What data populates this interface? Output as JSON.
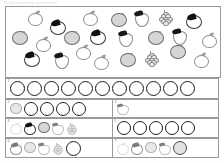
{
  "document": {
    "type": "worksheet",
    "header_text": "Fruit counting worksheet",
    "title": "Count the fruit"
  },
  "panel": {
    "name": "fruit-scatter-panel",
    "description": "Scattered mixed fruit illustration grid",
    "fruit_kinds": [
      "apple",
      "orange",
      "strawberry",
      "grape",
      "dark-cherry"
    ],
    "fruits": [
      {
        "kind": "orange",
        "x": 22,
        "y": 4,
        "size": 13,
        "shade": "outline"
      },
      {
        "kind": "dark",
        "x": 44,
        "y": 12,
        "size": 14,
        "shade": "outline"
      },
      {
        "kind": "orange",
        "x": 77,
        "y": 4,
        "size": 13,
        "shade": "outline"
      },
      {
        "kind": "apple",
        "x": 105,
        "y": 6,
        "size": 14,
        "shade": "shaded"
      },
      {
        "kind": "strawberry",
        "x": 128,
        "y": 4,
        "size": 14,
        "shade": "outline"
      },
      {
        "kind": "grape",
        "x": 152,
        "y": 3,
        "size": 14,
        "shade": "outline"
      },
      {
        "kind": "dark",
        "x": 180,
        "y": 6,
        "size": 14,
        "shade": "outline"
      },
      {
        "kind": "apple",
        "x": 6,
        "y": 24,
        "size": 14,
        "shade": "shaded"
      },
      {
        "kind": "apple",
        "x": 58,
        "y": 24,
        "size": 14,
        "shade": "shaded"
      },
      {
        "kind": "dark",
        "x": 84,
        "y": 22,
        "size": 14,
        "shade": "outline"
      },
      {
        "kind": "strawberry",
        "x": 112,
        "y": 24,
        "size": 14,
        "shade": "outline"
      },
      {
        "kind": "apple",
        "x": 142,
        "y": 24,
        "size": 14,
        "shade": "shaded"
      },
      {
        "kind": "strawberry",
        "x": 166,
        "y": 22,
        "size": 14,
        "shade": "outline"
      },
      {
        "kind": "orange",
        "x": 196,
        "y": 26,
        "size": 13,
        "shade": "outline"
      },
      {
        "kind": "orange",
        "x": 30,
        "y": 30,
        "size": 13,
        "shade": "outline"
      },
      {
        "kind": "dark",
        "x": 18,
        "y": 44,
        "size": 14,
        "shade": "outline"
      },
      {
        "kind": "strawberry",
        "x": 48,
        "y": 46,
        "size": 14,
        "shade": "outline"
      },
      {
        "kind": "orange",
        "x": 70,
        "y": 38,
        "size": 13,
        "shade": "outline"
      },
      {
        "kind": "orange",
        "x": 88,
        "y": 48,
        "size": 13,
        "shade": "outline"
      },
      {
        "kind": "apple",
        "x": 114,
        "y": 46,
        "size": 14,
        "shade": "shaded"
      },
      {
        "kind": "grape",
        "x": 138,
        "y": 44,
        "size": 14,
        "shade": "outline"
      },
      {
        "kind": "apple",
        "x": 164,
        "y": 38,
        "size": 14,
        "shade": "shaded"
      },
      {
        "kind": "orange",
        "x": 188,
        "y": 46,
        "size": 13,
        "shade": "outline"
      }
    ]
  },
  "rows": [
    {
      "number": "1",
      "name": "answer-row-1",
      "layout": "full",
      "cells": [
        {
          "number": "1",
          "circles": 11,
          "circle_size": "big",
          "fruits": []
        }
      ]
    },
    {
      "number": "2",
      "name": "answer-row-2",
      "layout": "split",
      "cells": [
        {
          "number": "2",
          "circles": 4,
          "circle_size": "med",
          "fruits": [
            {
              "kind": "apple",
              "shade": "pale"
            }
          ]
        },
        {
          "number": "3",
          "circles": 0,
          "circle_size": "med",
          "fruits": [
            {
              "kind": "strawberry",
              "shade": "pale"
            }
          ]
        }
      ]
    },
    {
      "number": "4",
      "name": "answer-row-3",
      "layout": "split",
      "cells": [
        {
          "number": "4",
          "circles": 0,
          "circle_size": "med",
          "fruits": [
            {
              "kind": "orange",
              "shade": "vpale"
            },
            {
              "kind": "dark",
              "shade": "outline"
            },
            {
              "kind": "apple",
              "shade": "shaded"
            },
            {
              "kind": "strawberry",
              "shade": "pale"
            },
            {
              "kind": "grape",
              "shade": "pale"
            }
          ]
        },
        {
          "number": "5",
          "circles": 5,
          "circle_size": "med",
          "fruits": []
        }
      ]
    },
    {
      "number": "6",
      "name": "answer-row-4",
      "layout": "split",
      "cells": [
        {
          "number": "6",
          "circles": 1,
          "circle_size": "big",
          "fruits": [
            {
              "kind": "dark",
              "shade": "pale"
            },
            {
              "kind": "apple",
              "shade": "pale"
            },
            {
              "kind": "strawberry",
              "shade": "pale"
            },
            {
              "kind": "grape",
              "shade": "pale"
            }
          ]
        },
        {
          "number": "7",
          "circles": 0,
          "circle_size": "big",
          "fruits": [
            {
              "kind": "orange",
              "shade": "vpale"
            },
            {
              "kind": "dark",
              "shade": "pale"
            },
            {
              "kind": "apple",
              "shade": "pale"
            },
            {
              "kind": "strawberry",
              "shade": "pale"
            },
            {
              "kind": "circle-filled",
              "shade": "shaded"
            }
          ]
        }
      ]
    }
  ],
  "colors": {
    "border": "#9a9a9a",
    "circle_stroke": "#1d1d1d",
    "fruit_dark": "#111111",
    "fruit_fill": "#d6d6d6",
    "page_background": "#ffffff"
  }
}
